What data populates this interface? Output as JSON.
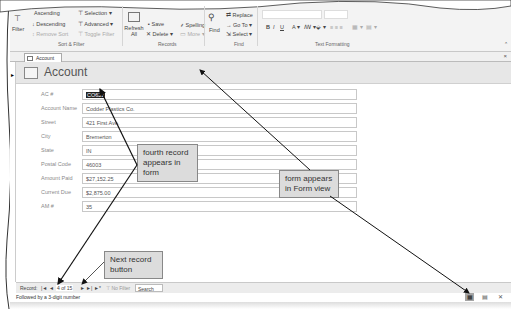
{
  "ribbon": {
    "sort_filter": {
      "filter": "Filter",
      "ascending": "Ascending",
      "descending": "Descending",
      "remove_sort": "Remove Sort",
      "selection": "Selection",
      "advanced": "Advanced",
      "toggle_filter": "Toggle Filter",
      "group_label": "Sort & Filter"
    },
    "records": {
      "refresh": "Refresh All",
      "new": "New",
      "save": "Save",
      "delete": "Delete",
      "totals": "Totals",
      "spelling": "Spelling",
      "more": "More",
      "group_label": "Records"
    },
    "find": {
      "find": "Find",
      "replace": "Replace",
      "goto": "Go To",
      "select": "Select",
      "group_label": "Find"
    },
    "text_formatting": {
      "bold": "B",
      "italic": "I",
      "underline": "U",
      "group_label": "Text Formatting"
    }
  },
  "document_tab": {
    "label": "Account",
    "close": "×"
  },
  "form": {
    "title": "Account",
    "fields": [
      {
        "label": "AC #",
        "value": "CO621",
        "selected": true
      },
      {
        "label": "Account Name",
        "value": "Codder Plastics Co."
      },
      {
        "label": "Street",
        "value": "421 First Ave."
      },
      {
        "label": "City",
        "value": "Bremerton"
      },
      {
        "label": "State",
        "value": "IN"
      },
      {
        "label": "Postal Code",
        "value": "46003"
      },
      {
        "label": "Amount Paid",
        "value": "$27,152.25"
      },
      {
        "label": "Current Due",
        "value": "$2,875.00"
      },
      {
        "label": "AM #",
        "value": "35"
      }
    ]
  },
  "navigation": {
    "record_label": "Record:",
    "first": "|◄",
    "prev": "◄",
    "position": "4 of 15",
    "next": "►",
    "last": "►|",
    "new": "►*",
    "filter_status": "No Filter",
    "search_placeholder": "Search"
  },
  "status_bar": {
    "text": "Followed by a 3-digit number"
  },
  "view_buttons": {
    "form_view": "▦",
    "layout_view": "▤",
    "design_view": "✕"
  },
  "callouts": {
    "fourth_record": "fourth record appears in form",
    "form_view": "form appears in Form view",
    "next_record": "Next record button"
  }
}
